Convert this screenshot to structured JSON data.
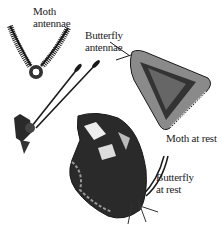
{
  "illustration": {
    "subject": "Moth vs butterfly comparison",
    "labels": {
      "moth_antennae": [
        "Moth",
        "antennae"
      ],
      "butterfly_antennae": [
        "Butterfly",
        "antennae"
      ],
      "moth_at_rest": "Moth at rest",
      "butterfly_at_rest": [
        "Butterfly",
        "at rest"
      ]
    }
  },
  "colors": {
    "ink": "#1a1a1a",
    "paper": "#ffffff",
    "mid": "#777777"
  }
}
